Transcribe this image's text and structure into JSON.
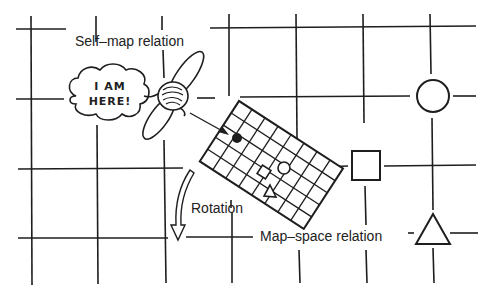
{
  "labels": {
    "self_map": "Self–map relation",
    "rotation": "Rotation",
    "map_space": "Map–space relation"
  },
  "bubble": {
    "line1": "I AM",
    "line2": "HERE!"
  },
  "colors": {
    "ink": "#1e1e1e",
    "background": "#ffffff"
  },
  "shapes": [
    "circle",
    "square",
    "triangle",
    "filled-dot"
  ]
}
